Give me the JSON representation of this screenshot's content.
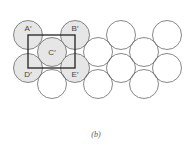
{
  "figure": {
    "caption": "(b)",
    "radius": 14.5,
    "colors": {
      "shaded": "#e6e6e6",
      "stroke": "#555555",
      "rect": "#222222",
      "label": "#444444"
    },
    "circles": [
      {
        "x": 28,
        "y": 35,
        "label": "A′",
        "shaded": true
      },
      {
        "x": 75,
        "y": 35,
        "label": "B′",
        "shaded": true
      },
      {
        "x": 121,
        "y": 35,
        "label": "",
        "shaded": false
      },
      {
        "x": 167,
        "y": 35,
        "label": "",
        "shaded": false
      },
      {
        "x": 52,
        "y": 52,
        "label": "C′",
        "shaded": true
      },
      {
        "x": 98,
        "y": 52,
        "label": "",
        "shaded": false
      },
      {
        "x": 144,
        "y": 52,
        "label": "",
        "shaded": false
      },
      {
        "x": 28,
        "y": 68,
        "label": "D′",
        "shaded": true
      },
      {
        "x": 75,
        "y": 68,
        "label": "E′",
        "shaded": true
      },
      {
        "x": 121,
        "y": 68,
        "label": "",
        "shaded": false
      },
      {
        "x": 167,
        "y": 68,
        "label": "",
        "shaded": false
      },
      {
        "x": 52,
        "y": 84,
        "label": "",
        "shaded": false
      },
      {
        "x": 98,
        "y": 84,
        "label": "",
        "shaded": false
      },
      {
        "x": 144,
        "y": 84,
        "label": "",
        "shaded": false
      }
    ],
    "unit_cell": {
      "x": 28,
      "y": 35,
      "w": 47,
      "h": 33
    }
  }
}
